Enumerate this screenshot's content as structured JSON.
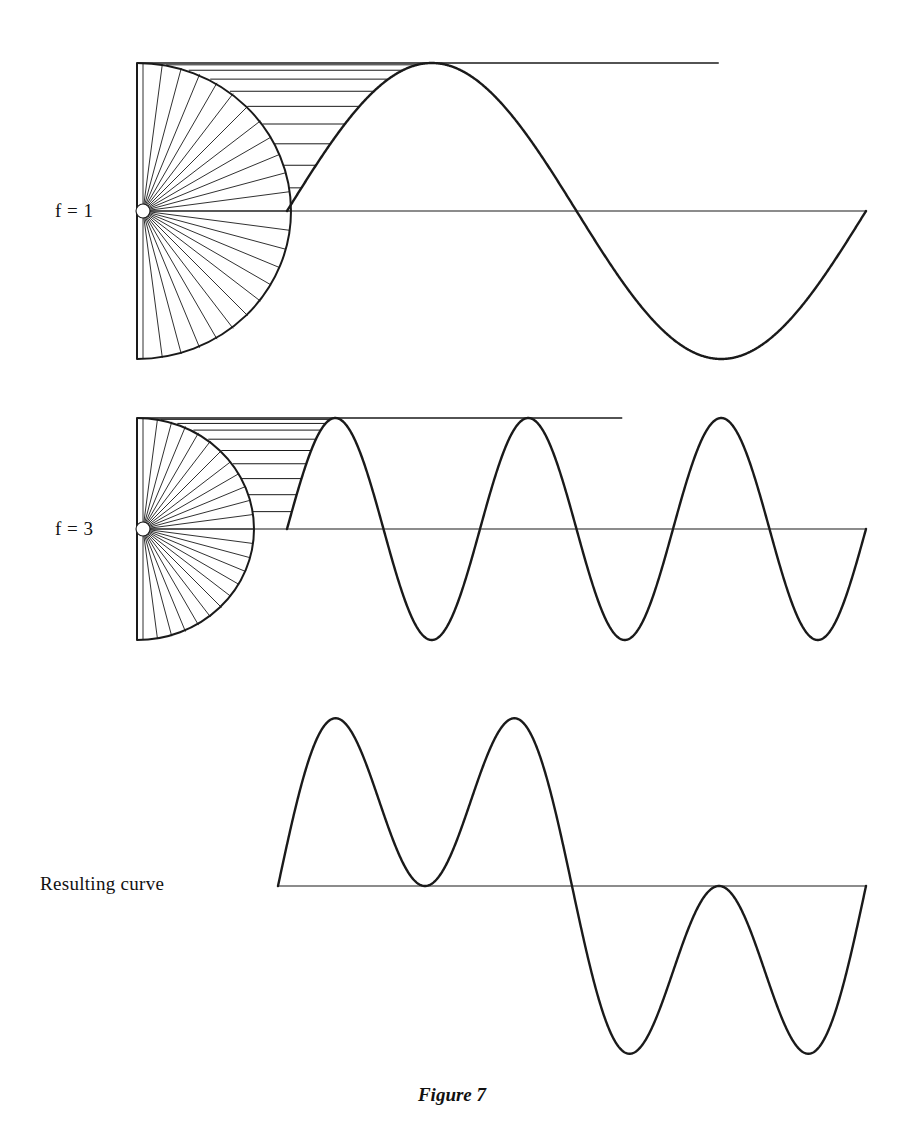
{
  "figure": {
    "caption": "Figure 7",
    "width": 904,
    "height": 1140,
    "background": "#ffffff",
    "ink_color": "#1a1a1a"
  },
  "labels": {
    "row1": "f  =  1",
    "row2": "f  =  3",
    "row3": "Resulting curve"
  },
  "chart_data": {
    "type": "line",
    "title": "Figure 7",
    "xlabel": "",
    "ylabel": "",
    "grid": false,
    "legend": null,
    "panels": [
      {
        "name": "f = 1",
        "label": "f  =  1",
        "frequency": 1,
        "amplitude": 1,
        "cycles": 1,
        "circle": {
          "cx": 143,
          "cy": 211,
          "r": 148,
          "spokes": 24
        },
        "axis": {
          "x0": 137,
          "x1": 866,
          "y": 211
        },
        "wave": {
          "x_start": 287,
          "x_end": 866,
          "peak_y": 63,
          "trough_y": 359
        },
        "projection_lines": 9,
        "series": [
          {
            "name": "sin(x)",
            "x": [
              0,
              0.25,
              0.5,
              0.75,
              1.0,
              1.25,
              1.5,
              1.75,
              2.0
            ],
            "values": [
              0,
              0.707,
              1,
              0.707,
              0,
              -0.707,
              -1,
              -0.707,
              0
            ]
          }
        ],
        "ylim": [
          -1,
          1
        ]
      },
      {
        "name": "f = 3",
        "label": "f  =  3",
        "frequency": 3,
        "amplitude": 1,
        "cycles": 3,
        "circle": {
          "cx": 143,
          "cy": 529,
          "r": 111,
          "spokes": 24
        },
        "axis": {
          "x0": 137,
          "x1": 866,
          "y": 529
        },
        "wave": {
          "x_start": 287,
          "x_end": 866,
          "peak_y": 418,
          "trough_y": 640
        },
        "projection_lines": 9,
        "series": [
          {
            "name": "sin(3x)",
            "x": [
              0,
              0.0833,
              0.1667,
              0.25,
              0.3333,
              0.4167,
              0.5,
              0.5833,
              0.6667,
              0.75,
              0.8333,
              0.9167,
              1.0,
              1.0833,
              1.1667,
              1.25,
              1.3333,
              1.4167,
              1.5,
              1.5833,
              1.6667,
              1.75,
              1.8333,
              1.9167,
              2.0
            ],
            "values": [
              0,
              0.707,
              1,
              0.707,
              0,
              -0.707,
              -1,
              -0.707,
              0,
              0.707,
              1,
              0.707,
              0,
              -0.707,
              -1,
              -0.707,
              0,
              0.707,
              1,
              0.707,
              0,
              -0.707,
              -1,
              -0.707,
              0
            ]
          }
        ],
        "ylim": [
          -1,
          1
        ]
      },
      {
        "name": "Resulting curve",
        "label": "Resulting curve",
        "axis": {
          "x0": 278,
          "x1": 866,
          "y": 886
        },
        "wave": {
          "x_start": 278,
          "x_end": 866,
          "peak_y": 700,
          "trough_y": 1060
        },
        "series": [
          {
            "name": "sin(x) + sin(3x)",
            "x": [
              0,
              0.125,
              0.25,
              0.375,
              0.5,
              0.625,
              0.75,
              0.875,
              1.0,
              1.125,
              1.25,
              1.375,
              1.5,
              1.625,
              1.75,
              1.875,
              2.0
            ],
            "values": [
              0,
              1.307,
              1.707,
              1.307,
              1.0,
              1.307,
              1.707,
              1.307,
              0,
              -1.307,
              -1.707,
              -1.307,
              -1.0,
              -1.307,
              -1.707,
              -1.307,
              0
            ]
          }
        ],
        "ylim": [
          -2,
          2
        ]
      }
    ]
  }
}
